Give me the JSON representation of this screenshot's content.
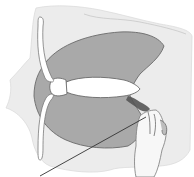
{
  "diagram": {
    "type": "anatomical-illustration",
    "colors": {
      "background": "#ffffff",
      "outer_tissue": "#ececec",
      "shaded_region": "#a9a9a9",
      "shaded_outline": "#6a6a6a",
      "bone": "#ffffff",
      "bone_outline": "#7a7a7a",
      "instrument_mark": "#555555",
      "pointer_line": "#333333"
    },
    "elements": [
      {
        "name": "outer-tissue",
        "label": ""
      },
      {
        "name": "shaded-crescent-region",
        "label": ""
      },
      {
        "name": "central-elongated-structure",
        "label": ""
      },
      {
        "name": "curved-bone-upper",
        "label": ""
      },
      {
        "name": "curved-bone-lower",
        "label": ""
      },
      {
        "name": "dark-instrument-mark",
        "label": ""
      },
      {
        "name": "hand",
        "label": ""
      },
      {
        "name": "pointer-line",
        "label": ""
      }
    ]
  }
}
